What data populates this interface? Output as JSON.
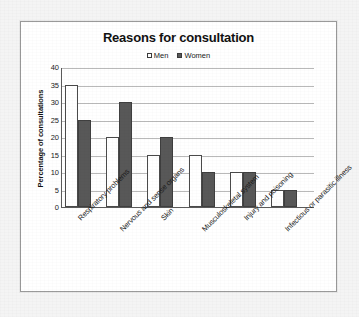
{
  "chart_data": {
    "type": "bar",
    "title": "Reasons for consultation",
    "xlabel": "",
    "ylabel": "Percentage of consultations",
    "ylim": [
      0,
      40
    ],
    "yticks": [
      0,
      5,
      10,
      15,
      20,
      25,
      30,
      35,
      40
    ],
    "grid": true,
    "legend_position": "top-center",
    "categories": [
      "Respiratory problems",
      "Nervous and sense organs",
      "Skin",
      "Musculoskeletal system",
      "Injury and poisoning",
      "Infectious or parasitic illness"
    ],
    "series": [
      {
        "name": "Men",
        "color": "#ffffff",
        "values": [
          35,
          20,
          15,
          15,
          10,
          5
        ]
      },
      {
        "name": "Women",
        "color": "#585858",
        "values": [
          25,
          30,
          20,
          10,
          10,
          5
        ]
      }
    ]
  },
  "colors": {
    "page_background": "#f4f4f4",
    "panel_background": "#ffffff",
    "panel_border": "#9a9a9a",
    "axis_line": "#5a5a5a",
    "gridline": "#b9b9b9",
    "men_fill": "#ffffff",
    "women_fill": "#585858",
    "text": "#1a1a1a"
  }
}
